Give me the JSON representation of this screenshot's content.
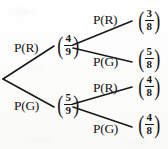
{
  "diagram": {
    "type": "probability-tree",
    "ink_color": "#161616",
    "paper_color": "#fdfdfd",
    "root": {
      "x": 3,
      "y": 79
    },
    "level1": [
      {
        "id": "level1-red",
        "edge_label": "P(R)",
        "edge_label_x": 14,
        "edge_label_y": 41,
        "node_probability": {
          "numerator": "4",
          "denominator": "9"
        },
        "node_x": 56,
        "node_y": 33,
        "vertex_x": 62,
        "vertex_y": 46
      },
      {
        "id": "level1-green",
        "edge_label": "P(G)",
        "edge_label_x": 14,
        "edge_label_y": 99,
        "node_probability": {
          "numerator": "5",
          "denominator": "9"
        },
        "node_x": 56,
        "node_y": 92,
        "vertex_x": 62,
        "vertex_y": 105
      }
    ],
    "level2": [
      {
        "id": "level2-red-red",
        "parent": "level1-red",
        "edge_label": "P(R)",
        "edge_label_x": 93,
        "edge_label_y": 13,
        "node_probability": {
          "numerator": "3",
          "denominator": "8"
        },
        "node_x": 137,
        "node_y": 8,
        "vertex_x": 135,
        "vertex_y": 21
      },
      {
        "id": "level2-red-green",
        "parent": "level1-red",
        "edge_label": "P(G)",
        "edge_label_x": 93,
        "edge_label_y": 55,
        "node_probability": {
          "numerator": "5",
          "denominator": "8"
        },
        "node_x": 137,
        "node_y": 46,
        "vertex_x": 135,
        "vertex_y": 59
      },
      {
        "id": "level2-green-red",
        "parent": "level1-green",
        "edge_label": "P(R)",
        "edge_label_x": 93,
        "edge_label_y": 81,
        "node_probability": {
          "numerator": "4",
          "denominator": "8"
        },
        "node_x": 137,
        "node_y": 74,
        "vertex_x": 135,
        "vertex_y": 87
      },
      {
        "id": "level2-green-green",
        "parent": "level1-green",
        "edge_label": "P(G)",
        "edge_label_x": 93,
        "edge_label_y": 122,
        "node_probability": {
          "numerator": "4",
          "denominator": "8"
        },
        "node_x": 137,
        "node_y": 112,
        "vertex_x": 135,
        "vertex_y": 125
      }
    ],
    "paren_left": "(",
    "paren_right": ")"
  }
}
